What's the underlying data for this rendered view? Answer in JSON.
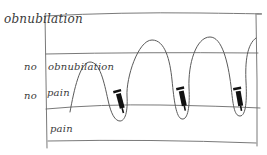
{
  "diagram": {
    "type": "hand-drawn sketch",
    "zones": {
      "top_label": "obnubilation",
      "upper_middle": {
        "prefix": "no",
        "label": "obnubilation"
      },
      "lower_middle": {
        "prefix": "no",
        "label": "pain"
      },
      "bottom_label": "pain"
    },
    "wave": {
      "description": "oscillating curve rising into the no-obnubilation zone and dipping into the pain zone",
      "peaks": 4,
      "troughs": 3
    },
    "markers": [
      {
        "icon": "syringe-icon",
        "position": "trough 1"
      },
      {
        "icon": "syringe-icon",
        "position": "trough 2"
      },
      {
        "icon": "syringe-icon",
        "position": "trough 3"
      }
    ],
    "colors": {
      "ink": "#555555",
      "marker": "#111111",
      "background": "#ffffff"
    }
  }
}
